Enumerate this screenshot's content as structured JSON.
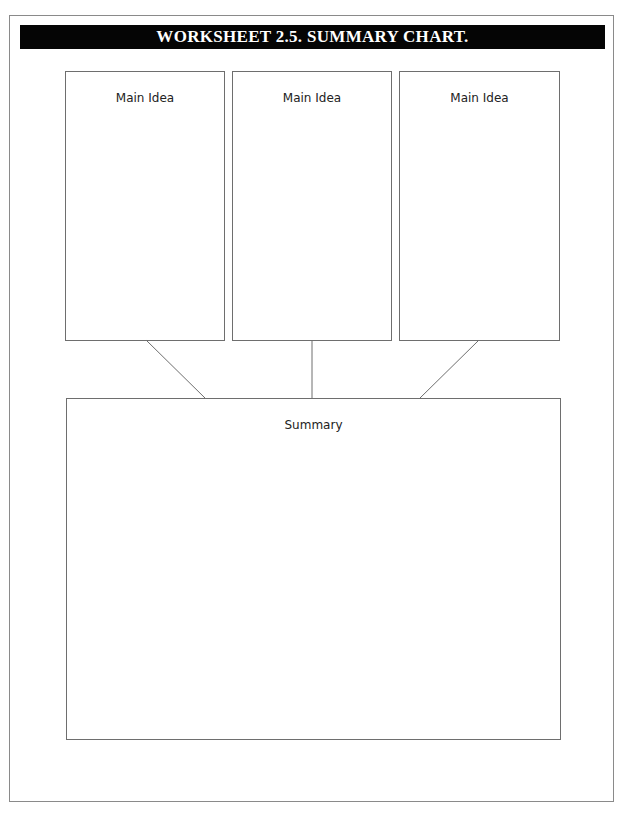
{
  "worksheet": {
    "title": "WORKSHEET 2.5. SUMMARY CHART.",
    "main_ideas": [
      {
        "label": "Main Idea"
      },
      {
        "label": "Main Idea"
      },
      {
        "label": "Main Idea"
      }
    ],
    "summary": {
      "label": "Summary"
    },
    "colors": {
      "title_bar_bg": "#050505",
      "title_text": "#ffffff",
      "border": "#6e6e6e"
    }
  }
}
